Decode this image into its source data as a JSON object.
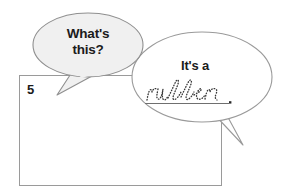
{
  "page": {
    "type": "worksheet-exercise",
    "background_color": "#ffffff",
    "item_number": "5"
  },
  "answer_box": {
    "name": "answer-box",
    "border_color": "#9a9a9a",
    "fill_color": "#ffffff",
    "content": ""
  },
  "bubbles": [
    {
      "id": "question-bubble",
      "role": "question",
      "text": "What's\nthis?",
      "fill_color": "#f0f0f0",
      "stroke_color": "#8f8f8f",
      "tail_direction": "down-left"
    },
    {
      "id": "answer-bubble",
      "role": "answer",
      "text": "It's a",
      "fill_color": "#ffffff",
      "stroke_color": "#9a9a9a",
      "tail_direction": "down-left"
    }
  ],
  "answer": {
    "lead_text": "It's a",
    "traced_word": "rubber",
    "traced_word_style": "dotted-cursive-tracing",
    "punctuation": ".",
    "writing_line": true,
    "trace_color": "#3a3a3a",
    "line_color": "#6f6f6f"
  }
}
